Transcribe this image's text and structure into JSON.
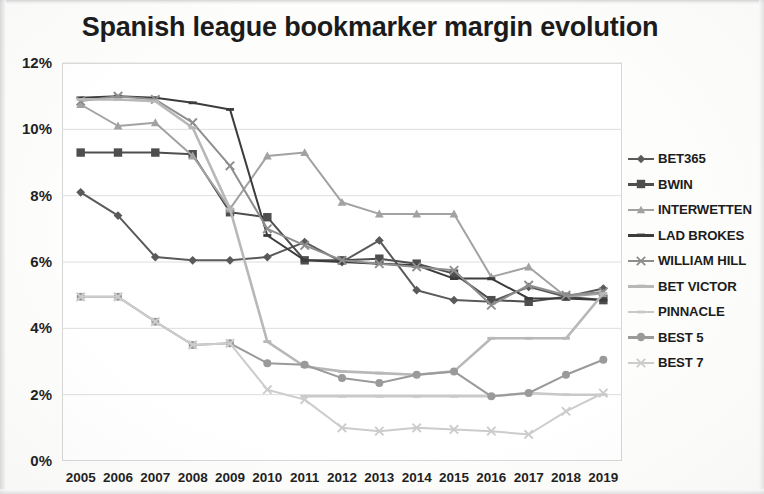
{
  "chart_title": "Spanish league bookmarker margin evolution",
  "axes": {
    "y_ticks": [
      "0%",
      "2%",
      "4%",
      "6%",
      "8%",
      "10%",
      "12%"
    ],
    "x_ticks": [
      "2005",
      "2006",
      "2007",
      "2008",
      "2009",
      "2010",
      "2011",
      "2012",
      "2013",
      "2014",
      "2015",
      "2016",
      "2017",
      "2018",
      "2019"
    ]
  },
  "legend": {
    "items": [
      {
        "label": "BET365",
        "marker": "diamond",
        "color": "#5a5a5a"
      },
      {
        "label": "BWIN",
        "marker": "square",
        "color": "#4e4e4e"
      },
      {
        "label": "INTERWETTEN",
        "marker": "triangle",
        "color": "#a2a2a2"
      },
      {
        "label": "LAD BROKES",
        "marker": "none",
        "color": "#3c3c3c"
      },
      {
        "label": "WILLIAM HILL",
        "marker": "cross",
        "color": "#8e8e8e"
      },
      {
        "label": "BET VICTOR",
        "marker": "none",
        "color": "#b8b8b8"
      },
      {
        "label": "PINNACLE",
        "marker": "none",
        "color": "#c9c9c9"
      },
      {
        "label": "BEST 5",
        "marker": "circle",
        "color": "#9a9a9a"
      },
      {
        "label": "BEST 7",
        "marker": "cross",
        "color": "#cccccc"
      }
    ]
  },
  "chart_data": {
    "type": "line",
    "title": "Spanish league bookmarker margin evolution",
    "xlabel": "",
    "ylabel": "",
    "ylim": [
      0,
      12
    ],
    "y_unit": "%",
    "grid": true,
    "legend_position": "right",
    "categories": [
      "2005",
      "2006",
      "2007",
      "2008",
      "2009",
      "2010",
      "2011",
      "2012",
      "2013",
      "2014",
      "2015",
      "2016",
      "2017",
      "2018",
      "2019"
    ],
    "series": [
      {
        "name": "BET365",
        "marker": "diamond",
        "color": "#5a5a5a",
        "values": [
          8.1,
          7.4,
          6.15,
          6.05,
          6.05,
          6.15,
          6.6,
          6.0,
          6.65,
          5.15,
          4.85,
          4.8,
          5.25,
          4.95,
          5.2
        ]
      },
      {
        "name": "BWIN",
        "marker": "square",
        "color": "#4e4e4e",
        "values": [
          9.3,
          9.3,
          9.3,
          9.25,
          7.5,
          7.35,
          6.05,
          6.05,
          6.1,
          5.95,
          5.65,
          4.85,
          4.8,
          4.95,
          4.85
        ]
      },
      {
        "name": "INTERWETTEN",
        "marker": "triangle",
        "color": "#a2a2a2",
        "values": [
          10.75,
          10.1,
          10.2,
          9.2,
          7.6,
          9.2,
          9.3,
          7.8,
          7.45,
          7.45,
          7.45,
          5.55,
          5.85,
          4.95,
          5.05
        ]
      },
      {
        "name": "LAD BROKES",
        "marker": "none",
        "color": "#3c3c3c",
        "values": [
          10.95,
          11.0,
          10.95,
          10.8,
          10.6,
          6.8,
          6.05,
          6.0,
          5.95,
          5.9,
          5.5,
          5.5,
          4.9,
          4.9,
          4.85
        ]
      },
      {
        "name": "WILLIAM HILL",
        "marker": "cross",
        "color": "#8e8e8e",
        "values": [
          10.85,
          11.0,
          10.9,
          10.2,
          8.9,
          7.0,
          6.5,
          6.05,
          5.95,
          5.85,
          5.75,
          4.7,
          5.3,
          5.0,
          5.1
        ]
      },
      {
        "name": "BET VICTOR",
        "marker": "none",
        "color": "#b8b8b8",
        "values": [
          10.9,
          10.9,
          10.85,
          10.05,
          7.6,
          3.6,
          2.85,
          2.7,
          2.65,
          2.6,
          2.7,
          3.7,
          3.7,
          3.7,
          5.05
        ]
      },
      {
        "name": "PINNACLE",
        "marker": "none",
        "color": "#c9c9c9",
        "values": [
          null,
          null,
          null,
          null,
          null,
          null,
          1.95,
          1.95,
          1.95,
          1.95,
          1.95,
          1.95,
          2.05,
          2.0,
          2.0
        ]
      },
      {
        "name": "BEST 5",
        "marker": "circle",
        "color": "#9a9a9a",
        "values": [
          4.95,
          4.95,
          4.2,
          3.5,
          3.55,
          2.95,
          2.9,
          2.5,
          2.35,
          2.6,
          2.7,
          1.95,
          2.05,
          2.6,
          3.05
        ]
      },
      {
        "name": "BEST 7",
        "marker": "cross",
        "color": "#cccccc",
        "values": [
          4.95,
          4.95,
          4.2,
          3.5,
          3.55,
          2.15,
          1.85,
          1.0,
          0.9,
          1.0,
          0.95,
          0.9,
          0.8,
          1.5,
          2.05
        ]
      }
    ]
  }
}
